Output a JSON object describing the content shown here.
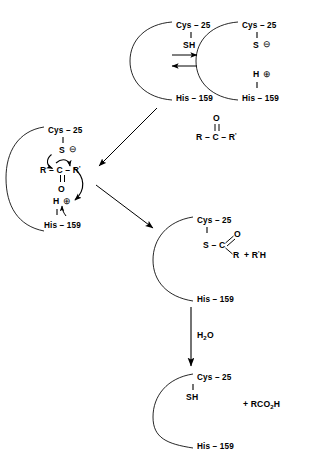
{
  "diagram": {
    "type": "reaction-mechanism",
    "residues": {
      "cys": "Cys – 25",
      "his": "His – 159"
    }
  },
  "structures": {
    "s1": {
      "name": "enzyme-resting-state",
      "cys": "Cys – 25",
      "thiol": "SH",
      "his": "His – 159"
    },
    "s2": {
      "name": "ion-pair-state",
      "cys": "Cys – 25",
      "sulfur": "S",
      "sulfur_charge": "⊖",
      "hydrogen": "H",
      "hydrogen_charge": "⊕",
      "his": "His – 159"
    },
    "s3": {
      "name": "tetrahedral-intermediate",
      "cys": "Cys – 25",
      "sulfur": "S",
      "sulfur_charge": "⊖",
      "substrate_left": "R – C – R",
      "substrate_r": "R",
      "substrate_c": "C",
      "substrate_rprime": "R",
      "prime": "'",
      "carbonyl_o": "O",
      "hydrogen": "H",
      "hydrogen_charge": "⊕",
      "his": "His – 159"
    },
    "s4": {
      "name": "acyl-enzyme-intermediate",
      "cys": "Cys – 25",
      "sulfur": "S",
      "carbon": "C",
      "oxygen": "O",
      "r_group": "R",
      "leaving_group": "+ R",
      "leaving_group_prime": "'",
      "leaving_group_h": "H",
      "his": "His – 159"
    },
    "s5": {
      "name": "regenerated-enzyme",
      "cys": "Cys – 25",
      "thiol": "SH",
      "his": "His – 159",
      "product_prefix": "+ RCO",
      "product_sub": "2",
      "product_suffix": "H"
    }
  },
  "reagents": {
    "substrate": {
      "name": "ketone-substrate",
      "oxygen": "O",
      "r": "R",
      "c": "C",
      "rprime": "R",
      "prime": "'",
      "formula": "R – C – R'"
    },
    "water": {
      "name": "water",
      "prefix": "H",
      "sub": "2",
      "suffix": "O"
    }
  },
  "arrows": {
    "equilibrium": "equilibrium-double-arrow",
    "substrate_binding": "diagonal-arrow-substrate-binding",
    "acylation": "diagonal-arrow-acylation",
    "hydrolysis": "vertical-arrow-hydrolysis"
  },
  "colors": {
    "ink": "#000000",
    "background": "#ffffff"
  }
}
